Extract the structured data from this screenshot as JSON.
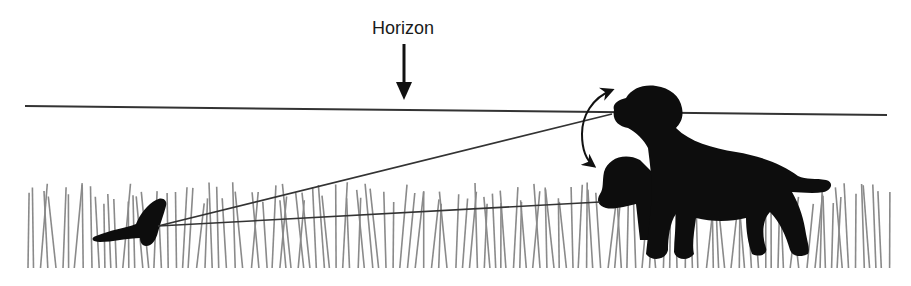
{
  "diagram": {
    "horizon_label": "Horizon",
    "elements": [
      {
        "name": "horizon-line",
        "description": "Horizon line"
      },
      {
        "name": "arrow-down-icon",
        "description": "Arrow pointing down to horizon"
      },
      {
        "name": "adult-dog",
        "description": "Adult dog silhouette, head raised to horizon level"
      },
      {
        "name": "young-dog",
        "description": "Smaller dog silhouette, head lowered into grass"
      },
      {
        "name": "small-animal",
        "description": "Small mustelid silhouette in grass"
      },
      {
        "name": "sight-lines",
        "description": "Lines of sight from dog eyes to the small animal"
      },
      {
        "name": "curved-double-arrow-icon",
        "description": "Curved double-headed arrow indicating head movement"
      },
      {
        "name": "grass",
        "description": "Tall grass strip"
      }
    ],
    "colors": {
      "line": "#333333",
      "silhouette": "#0d0d0d",
      "grass": "#8a8a8a"
    }
  }
}
